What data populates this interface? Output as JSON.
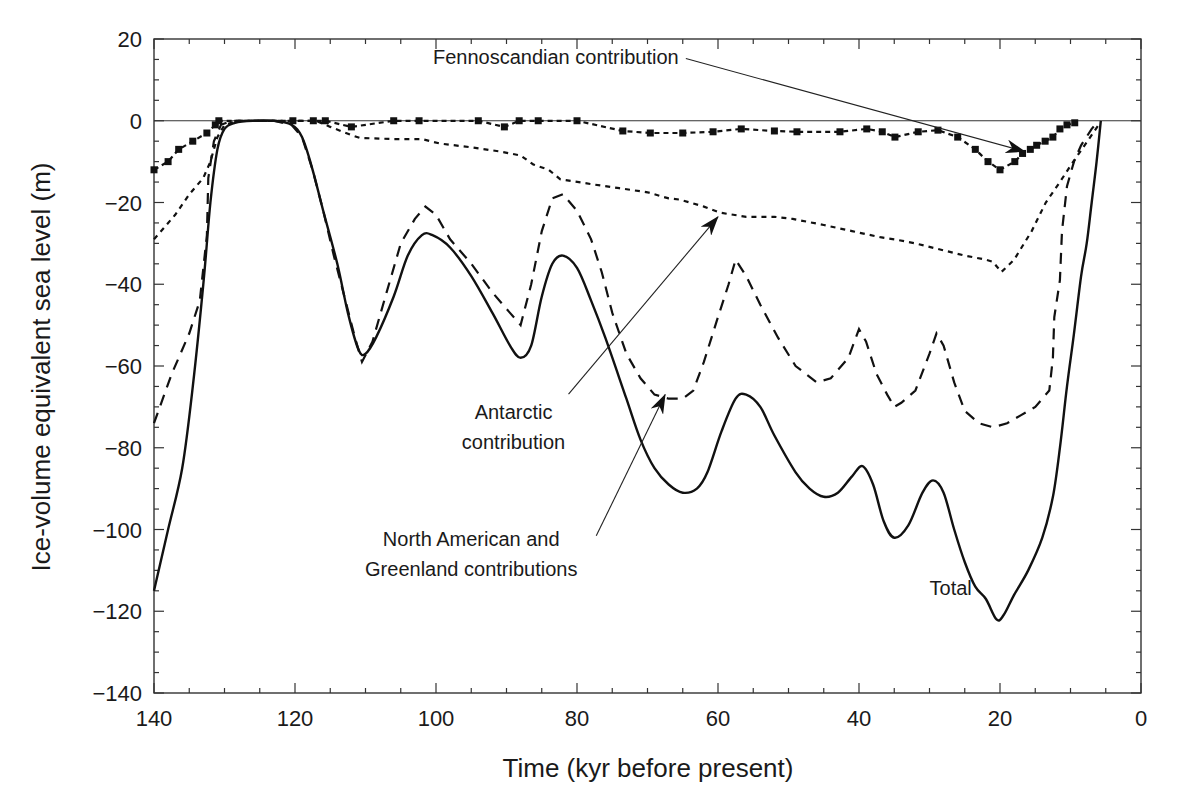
{
  "chart_data": {
    "type": "line",
    "title": "",
    "xlabel": "Time (kyr before present)",
    "ylabel": "Ice-volume equivalent sea level (m)",
    "xlim": [
      140,
      0
    ],
    "ylim": [
      -140,
      20
    ],
    "x_reversed": true,
    "grid": false,
    "legend": "none (curves labelled by annotations)",
    "x_ticks": [
      140,
      120,
      100,
      80,
      60,
      40,
      20,
      0
    ],
    "y_ticks": [
      20,
      0,
      -20,
      -40,
      -60,
      -80,
      -100,
      -120,
      -140
    ],
    "x_tick_labels": [
      "140",
      "120",
      "100",
      "80",
      "60",
      "40",
      "20",
      "0"
    ],
    "y_tick_labels": [
      "20",
      "0",
      "−20",
      "−40",
      "−60",
      "−80",
      "−100",
      "−120",
      "−140"
    ],
    "minor_tick_step": 5,
    "zero_line": true,
    "series": [
      {
        "name": "Total",
        "style": "solid",
        "points": [
          [
            140,
            -115
          ],
          [
            138,
            -100
          ],
          [
            136,
            -85
          ],
          [
            134.5,
            -65
          ],
          [
            133,
            -40
          ],
          [
            132,
            -20
          ],
          [
            131,
            -7
          ],
          [
            130,
            -2
          ],
          [
            128.5,
            -0.5
          ],
          [
            126,
            0
          ],
          [
            123,
            0
          ],
          [
            120.5,
            -1
          ],
          [
            119,
            -4
          ],
          [
            117.5,
            -12
          ],
          [
            116,
            -22
          ],
          [
            114,
            -35
          ],
          [
            112.5,
            -47
          ],
          [
            111,
            -56
          ],
          [
            110,
            -57
          ],
          [
            108.5,
            -53
          ],
          [
            106,
            -43
          ],
          [
            104,
            -33
          ],
          [
            102,
            -28
          ],
          [
            100.5,
            -28
          ],
          [
            98,
            -31
          ],
          [
            95,
            -38
          ],
          [
            92,
            -47
          ],
          [
            89.5,
            -55
          ],
          [
            88,
            -58
          ],
          [
            86.5,
            -55
          ],
          [
            85,
            -43
          ],
          [
            83.5,
            -35
          ],
          [
            82,
            -33
          ],
          [
            80,
            -36
          ],
          [
            78,
            -44
          ],
          [
            76,
            -53
          ],
          [
            73,
            -68
          ],
          [
            71,
            -78
          ],
          [
            69,
            -85
          ],
          [
            67,
            -89
          ],
          [
            65,
            -91
          ],
          [
            63,
            -90
          ],
          [
            61.5,
            -86
          ],
          [
            59.5,
            -76
          ],
          [
            57.5,
            -68
          ],
          [
            56,
            -67
          ],
          [
            54,
            -70
          ],
          [
            52,
            -77
          ],
          [
            49,
            -86
          ],
          [
            47,
            -90
          ],
          [
            45,
            -92
          ],
          [
            43,
            -91
          ],
          [
            41,
            -87
          ],
          [
            39.5,
            -84.5
          ],
          [
            38,
            -89
          ],
          [
            36.5,
            -98
          ],
          [
            35,
            -102
          ],
          [
            33,
            -99
          ],
          [
            31,
            -91
          ],
          [
            29.5,
            -88
          ],
          [
            28,
            -91
          ],
          [
            26.5,
            -100
          ],
          [
            25,
            -108
          ],
          [
            23.5,
            -114
          ],
          [
            22,
            -117
          ],
          [
            20.5,
            -122
          ],
          [
            19.5,
            -121
          ],
          [
            18,
            -116
          ],
          [
            16,
            -110
          ],
          [
            14,
            -102
          ],
          [
            12.5,
            -92
          ],
          [
            11.5,
            -80
          ],
          [
            10.5,
            -65
          ],
          [
            9.5,
            -52
          ],
          [
            8.5,
            -38
          ],
          [
            7.7,
            -30
          ],
          [
            7,
            -20
          ],
          [
            6.3,
            -10
          ],
          [
            5.7,
            0
          ]
        ]
      },
      {
        "name": "North American and Greenland contributions",
        "style": "dashed",
        "points": [
          [
            140,
            -74
          ],
          [
            137.5,
            -62
          ],
          [
            135,
            -52
          ],
          [
            133.5,
            -44
          ],
          [
            132.5,
            -28
          ],
          [
            132.3,
            -14
          ],
          [
            131.5,
            -5
          ],
          [
            130.5,
            -1
          ],
          [
            129,
            0
          ],
          [
            123,
            0
          ],
          [
            120.5,
            -1
          ],
          [
            119,
            -4
          ],
          [
            117.5,
            -12
          ],
          [
            116,
            -22
          ],
          [
            114.5,
            -33
          ],
          [
            113,
            -43
          ],
          [
            111.5,
            -53
          ],
          [
            110.5,
            -59
          ],
          [
            109,
            -54
          ],
          [
            107,
            -42
          ],
          [
            105,
            -30
          ],
          [
            103,
            -24
          ],
          [
            101.5,
            -21
          ],
          [
            100,
            -23
          ],
          [
            98,
            -29
          ],
          [
            95,
            -35
          ],
          [
            92,
            -42
          ],
          [
            89.5,
            -47
          ],
          [
            88,
            -50
          ],
          [
            86.5,
            -40
          ],
          [
            85,
            -27
          ],
          [
            83.5,
            -19
          ],
          [
            82,
            -18
          ],
          [
            80,
            -22
          ],
          [
            78,
            -29
          ],
          [
            76.5,
            -37
          ],
          [
            75,
            -47
          ],
          [
            73,
            -57
          ],
          [
            71,
            -63
          ],
          [
            69,
            -67
          ],
          [
            67,
            -68
          ],
          [
            65,
            -68
          ],
          [
            63.5,
            -66
          ],
          [
            62,
            -59
          ],
          [
            60,
            -48
          ],
          [
            58.5,
            -40
          ],
          [
            57.5,
            -34
          ],
          [
            56,
            -38
          ],
          [
            54,
            -45
          ],
          [
            51.5,
            -53
          ],
          [
            49,
            -60
          ],
          [
            46,
            -64
          ],
          [
            44,
            -63
          ],
          [
            41.5,
            -58
          ],
          [
            40,
            -51
          ],
          [
            39,
            -54
          ],
          [
            37.5,
            -62
          ],
          [
            36,
            -67
          ],
          [
            35,
            -70
          ],
          [
            34,
            -69
          ],
          [
            32,
            -66
          ],
          [
            30,
            -57
          ],
          [
            29,
            -52
          ],
          [
            28,
            -55
          ],
          [
            26.5,
            -64
          ],
          [
            25,
            -71
          ],
          [
            23,
            -74
          ],
          [
            21,
            -75
          ],
          [
            19,
            -74
          ],
          [
            17,
            -72
          ],
          [
            15,
            -70
          ],
          [
            13,
            -66
          ],
          [
            12.5,
            -58
          ],
          [
            12.3,
            -48
          ],
          [
            11.5,
            -39
          ],
          [
            11.2,
            -27
          ],
          [
            10.5,
            -16
          ],
          [
            9.5,
            -10
          ],
          [
            8.5,
            -6
          ],
          [
            7,
            -2
          ],
          [
            6,
            0
          ]
        ]
      },
      {
        "name": "Antarctic contribution",
        "style": "dotted",
        "points": [
          [
            140,
            -29
          ],
          [
            137,
            -23
          ],
          [
            135,
            -18
          ],
          [
            133,
            -14
          ],
          [
            132,
            -10
          ],
          [
            131,
            -4
          ],
          [
            130,
            -1
          ],
          [
            128,
            0
          ],
          [
            117,
            0
          ],
          [
            115,
            -1.5
          ],
          [
            112,
            -3.5
          ],
          [
            110.8,
            -4.2
          ],
          [
            106,
            -4.5
          ],
          [
            102,
            -4.5
          ],
          [
            99.4,
            -5.6
          ],
          [
            95,
            -6.5
          ],
          [
            91,
            -7.5
          ],
          [
            88,
            -8.5
          ],
          [
            86.2,
            -10.7
          ],
          [
            84,
            -12
          ],
          [
            82.4,
            -14.3
          ],
          [
            78,
            -15.5
          ],
          [
            74,
            -16.5
          ],
          [
            70,
            -17.5
          ],
          [
            67,
            -19
          ],
          [
            65.4,
            -19.3
          ],
          [
            62,
            -21
          ],
          [
            59.7,
            -22.5
          ],
          [
            56,
            -23.5
          ],
          [
            52,
            -23.5
          ],
          [
            49.4,
            -24
          ],
          [
            45,
            -25.5
          ],
          [
            41,
            -27
          ],
          [
            37,
            -28.5
          ],
          [
            35,
            -29
          ],
          [
            32,
            -30
          ],
          [
            28.5,
            -31.5
          ],
          [
            25,
            -33
          ],
          [
            22,
            -34
          ],
          [
            21,
            -34.5
          ],
          [
            19.8,
            -37
          ],
          [
            18,
            -34
          ],
          [
            15.5,
            -27
          ],
          [
            13.5,
            -20
          ],
          [
            11.5,
            -15
          ],
          [
            10,
            -11
          ],
          [
            8,
            -6
          ],
          [
            6,
            -1
          ]
        ]
      },
      {
        "name": "Fennoscandian contribution",
        "style": "dotted-with-square-markers",
        "points": [
          [
            140,
            -12
          ],
          [
            138,
            -10
          ],
          [
            136.5,
            -7
          ],
          [
            134.5,
            -5
          ],
          [
            132.5,
            -3
          ],
          [
            131.3,
            -1
          ],
          [
            130.8,
            0
          ],
          [
            120.3,
            0
          ],
          [
            117.4,
            0
          ],
          [
            115.7,
            0
          ],
          [
            112,
            -1.5
          ],
          [
            106,
            0
          ],
          [
            102.4,
            0
          ],
          [
            94,
            0
          ],
          [
            90.3,
            -1.5
          ],
          [
            88.2,
            0
          ],
          [
            85.5,
            0
          ],
          [
            80,
            0
          ],
          [
            73.5,
            -2.5
          ],
          [
            69.6,
            -3
          ],
          [
            65,
            -3
          ],
          [
            60.7,
            -2.7
          ],
          [
            56.7,
            -2
          ],
          [
            52,
            -2.5
          ],
          [
            48.8,
            -2.7
          ],
          [
            42.7,
            -2.7
          ],
          [
            38.9,
            -2
          ],
          [
            36.7,
            -2.7
          ],
          [
            34.9,
            -4
          ],
          [
            31.6,
            -2.7
          ],
          [
            28.8,
            -2.3
          ],
          [
            26,
            -4
          ],
          [
            23.5,
            -7
          ],
          [
            21.7,
            -10
          ],
          [
            20,
            -12
          ],
          [
            17.9,
            -10
          ],
          [
            16.8,
            -8
          ],
          [
            15.7,
            -7
          ],
          [
            14.8,
            -6
          ],
          [
            13.6,
            -5
          ],
          [
            12.5,
            -4
          ],
          [
            11.5,
            -2
          ],
          [
            10.5,
            -1
          ],
          [
            9.4,
            -0.5
          ]
        ]
      }
    ],
    "annotations": [
      {
        "text": "Fennoscandian contribution",
        "x_kyr": 83,
        "y_m": 14,
        "arrow_to": [
          16.5,
          -7.5
        ]
      },
      {
        "text": "Antarctic contribution",
        "lines": [
          "Antarctic",
          "contribution"
        ],
        "x_kyr": 89,
        "y_m": -73,
        "arrow_to": [
          60,
          -23.5
        ]
      },
      {
        "text": "North American and Greenland contributions",
        "lines": [
          "North  American and",
          "Greenland  contributions"
        ],
        "x_kyr": 95,
        "y_m": -104,
        "arrow_to": [
          67.5,
          -67
        ]
      },
      {
        "text": "Total",
        "x_kyr": 27,
        "y_m": -116
      }
    ]
  }
}
